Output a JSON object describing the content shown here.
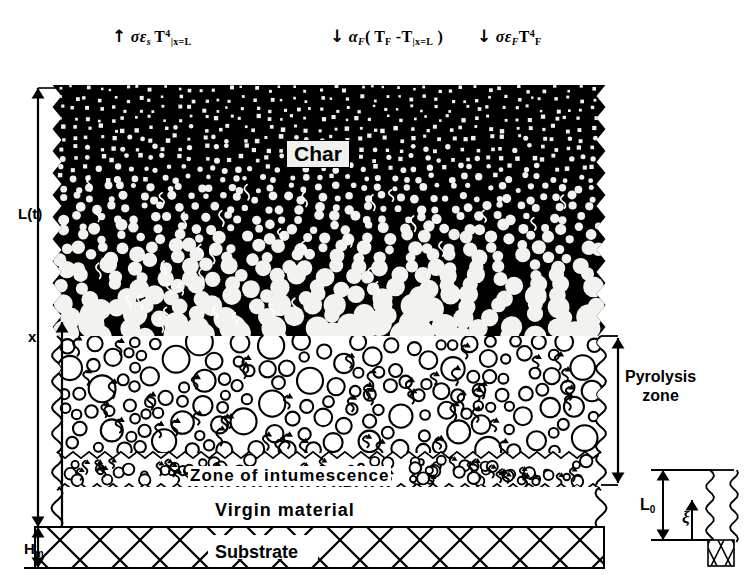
{
  "figure": {
    "background_color": "#ffffff",
    "ink_color": "#000000"
  },
  "heat_flux_labels": [
    {
      "id": "reradiation",
      "arrow": "↑",
      "direction": "up",
      "text": "σε",
      "sub1": "s",
      "symbol2": "T",
      "sup": "4",
      "sub2": "|x=L",
      "plain": "↑ σεs T⁴|x=L"
    },
    {
      "id": "convection",
      "arrow": "↓",
      "direction": "down",
      "alpha": "α",
      "alpha_sub": "F",
      "open_paren": "(",
      "t1": "T",
      "t1_sub": "F",
      "minus": "-",
      "t2": "T",
      "t2_sub": "|x=L",
      "close_paren": ")",
      "plain": "↓ αF ( TF - T|x=L )"
    },
    {
      "id": "fire-radiation",
      "arrow": "↓",
      "direction": "down",
      "text": "σε",
      "sub1": "F",
      "symbol2": "T",
      "sup": "4",
      "sub2": "F",
      "plain": "↓ σεF TF⁴"
    }
  ],
  "axes": [
    {
      "id": "total-thickness",
      "label": "L(t)",
      "type": "double-arrow-vertical"
    },
    {
      "id": "coordinate-x",
      "label": "x",
      "type": "single-arrow-up"
    },
    {
      "id": "substrate-thickness",
      "label": "H",
      "sub": "m",
      "type": "double-arrow-vertical"
    }
  ],
  "layers": [
    {
      "id": "char",
      "label": "Char",
      "style": "black-with-white-bubbles"
    },
    {
      "id": "pyrolysis",
      "label": "",
      "style": "white-with-outlined-bubbles"
    },
    {
      "id": "intumescence",
      "label": "Zone of intumescence",
      "style": "white-with-small-bubbles"
    },
    {
      "id": "virgin",
      "label": "Virgin material",
      "style": "plain-white"
    },
    {
      "id": "substrate",
      "label": "Substrate",
      "style": "cross-hatched"
    }
  ],
  "brackets": [
    {
      "id": "pyrolysis-zone",
      "line1": "Pyrolysis",
      "line2": "zone"
    }
  ],
  "inset": {
    "id": "initial-state-inset",
    "height_label": "L",
    "height_sub": "0",
    "coordinate_label": "ξ",
    "substrate_hatch": "cross"
  }
}
